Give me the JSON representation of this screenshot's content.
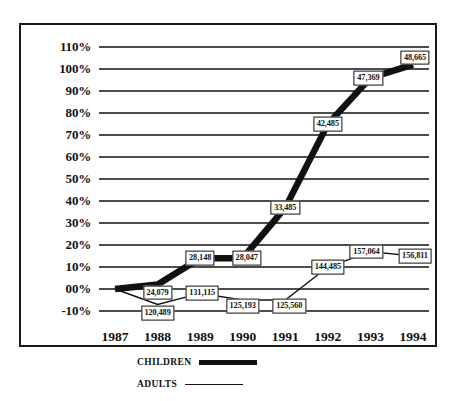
{
  "chart_data": {
    "type": "line",
    "title": "",
    "xlabel": "",
    "ylabel": "",
    "categories": [
      "1987",
      "1988",
      "1989",
      "1990",
      "1991",
      "1992",
      "1993",
      "1994"
    ],
    "ylim": [
      -10,
      110
    ],
    "ytick_labels": [
      "110%",
      "100%",
      "90%",
      "80%",
      "70%",
      "60%",
      "50%",
      "40%",
      "30%",
      "20%",
      "10%",
      "00%",
      "-10%"
    ],
    "ytick_values": [
      110,
      100,
      90,
      80,
      70,
      60,
      50,
      40,
      30,
      20,
      10,
      0,
      -10
    ],
    "grid": true,
    "legend_position": "bottom",
    "series": [
      {
        "name": "CHILDREN",
        "style": "thick",
        "values": [
          0,
          2,
          14,
          14,
          37,
          75,
          96,
          102
        ],
        "point_labels": [
          "",
          "24,079",
          "28,148",
          "28,047",
          "33,485",
          "42,485",
          "47,369",
          "48,665"
        ]
      },
      {
        "name": "ADULTS",
        "style": "thin",
        "values": [
          0,
          -7,
          -2,
          -5,
          -5,
          10,
          17,
          15
        ],
        "point_labels": [
          "",
          "120,489",
          "131,115",
          "125,193",
          "125,560",
          "144,485",
          "157,064",
          "156,811"
        ]
      }
    ]
  },
  "legend": {
    "children_label": "CHILDREN",
    "adults_label": "ADULTS"
  },
  "colors": {
    "line": "#111111",
    "grid": "#111111",
    "background": "#ffffff",
    "frame": "#1a1a1a"
  }
}
